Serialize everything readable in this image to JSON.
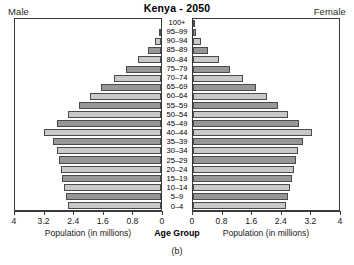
{
  "header": {
    "title": "Kenya - 2050",
    "male_label": "Male",
    "female_label": "Female"
  },
  "axis": {
    "male_caption": "Population (in millions)",
    "female_caption": "Population (in millions)",
    "center_caption": "Age Group",
    "male_ticks": [
      "4",
      "3.2",
      "2.4",
      "1.6",
      "0.8",
      "0"
    ],
    "female_ticks": [
      "0",
      "0.8",
      "1.6",
      "2.4",
      "3.2",
      "4"
    ]
  },
  "figure_caption": "(b)",
  "colors": {
    "bar_light": "#c9c9c9",
    "bar_dark": "#979797",
    "bar_border": "#4a4a4a",
    "frame": "#3a3a3a",
    "text": "#1a1a1a"
  },
  "chart_data": {
    "type": "bar",
    "subtype": "population-pyramid",
    "title": "Kenya - 2050",
    "xlabel": "Population (in millions)",
    "ylabel": "Age Group",
    "xlim": [
      0,
      4
    ],
    "xticks": [
      0,
      0.8,
      1.6,
      2.4,
      3.2,
      4
    ],
    "grid": false,
    "legend": "none",
    "orientation": "horizontal",
    "categories": [
      "0-4",
      "5-9",
      "10-14",
      "15-19",
      "20-24",
      "25-29",
      "30-34",
      "35-39",
      "40-44",
      "45-49",
      "50-54",
      "55-59",
      "60-64",
      "65-69",
      "70-74",
      "75-79",
      "80-84",
      "85-89",
      "90-94",
      "95-99",
      "100+"
    ],
    "series": [
      {
        "name": "Male",
        "side": "left",
        "values": [
          2.55,
          2.6,
          2.65,
          2.7,
          2.75,
          2.8,
          2.85,
          2.95,
          3.2,
          2.85,
          2.55,
          2.25,
          1.95,
          1.65,
          1.3,
          0.95,
          0.62,
          0.35,
          0.17,
          0.06,
          0.01
        ]
      },
      {
        "name": "Female",
        "side": "right",
        "values": [
          2.55,
          2.6,
          2.65,
          2.72,
          2.78,
          2.83,
          2.88,
          3.0,
          3.25,
          2.9,
          2.6,
          2.32,
          2.02,
          1.72,
          1.38,
          1.02,
          0.7,
          0.42,
          0.22,
          0.08,
          0.02
        ]
      }
    ]
  }
}
